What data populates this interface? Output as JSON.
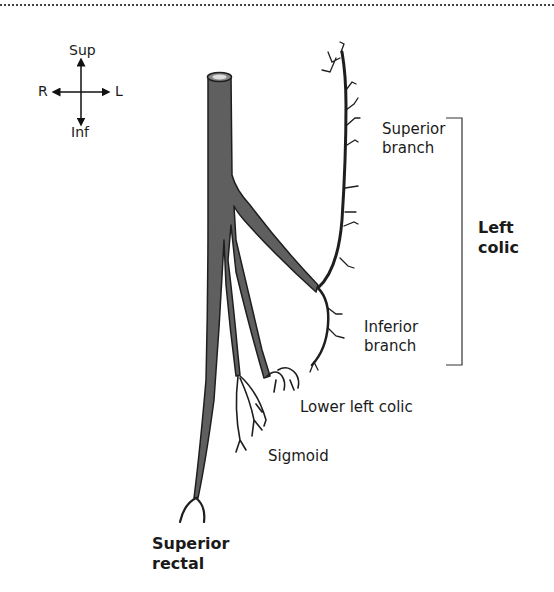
{
  "orientation": {
    "sup": "Sup",
    "inf": "Inf",
    "right": "R",
    "left": "L"
  },
  "labels": {
    "superior_branch": "Superior\nbranch",
    "inferior_branch": "Inferior\nbranch",
    "left_colic": "Left\ncolic",
    "lower_left_colic": "Lower left colic",
    "sigmoid": "Sigmoid",
    "superior_rectal": "Superior\nrectal"
  },
  "colors": {
    "vessel_fill": "#5f5f5f",
    "vessel_outline": "#1e1e1e",
    "text": "#1a1a1a",
    "background": "#ffffff"
  }
}
